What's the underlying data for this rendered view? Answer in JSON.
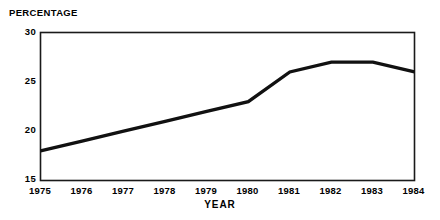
{
  "chart_data": {
    "type": "line",
    "title": "",
    "xlabel": "YEAR",
    "ylabel": "PERCENTAGE",
    "x": [
      1975,
      1976,
      1977,
      1978,
      1979,
      1980,
      1981,
      1982,
      1983,
      1984
    ],
    "categories": [
      "1975",
      "1976",
      "1977",
      "1978",
      "1979",
      "1980",
      "1981",
      "1982",
      "1983",
      "1984"
    ],
    "values": [
      18,
      19,
      20,
      21,
      22,
      23,
      26,
      27,
      27,
      26
    ],
    "series": [
      {
        "name": "percentage",
        "values": [
          18,
          19,
          20,
          21,
          22,
          23,
          26,
          27,
          27,
          26
        ]
      }
    ],
    "xlim": [
      1975,
      1984
    ],
    "ylim": [
      15,
      30
    ],
    "yticks": [
      15,
      20,
      25,
      30
    ],
    "ytick_labels": [
      "15",
      "20",
      "25",
      "30"
    ],
    "xticks": [
      1975,
      1976,
      1977,
      1978,
      1979,
      1980,
      1981,
      1982,
      1983,
      1984
    ],
    "xtick_labels": [
      "1975",
      "1976",
      "1977",
      "1978",
      "1979",
      "1980",
      "1981",
      "1982",
      "1983",
      "1984"
    ],
    "grid": false,
    "legend": null,
    "legend_position": "none",
    "line_color": "#111111",
    "frame_color": "#1a1a1a",
    "background_color": "#ffffff"
  },
  "axes": {
    "y_title": "PERCENTAGE",
    "x_title": "YEAR"
  }
}
